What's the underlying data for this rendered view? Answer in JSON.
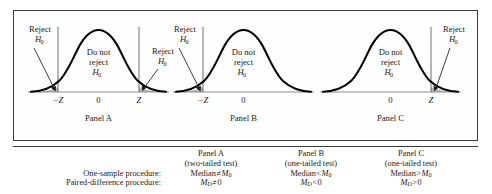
{
  "figure": {
    "panels": [
      {
        "id": "panel-a",
        "caption": "Panel A",
        "curve_label_line1": "Do not",
        "curve_label_line2": "reject",
        "curve_label_line3": "H",
        "curve_label_sub": "0",
        "axis_ticks": [
          "−Z",
          "0",
          "Z"
        ],
        "reject_labels": [
          {
            "line1": "Reject",
            "line2": "H",
            "sub": "0",
            "side": "left"
          },
          {
            "line1": "Reject",
            "line2": "H",
            "sub": "0",
            "side": "right"
          }
        ],
        "tails": [
          "left",
          "right"
        ]
      },
      {
        "id": "panel-b",
        "caption": "Panel B",
        "curve_label_line1": "Do not",
        "curve_label_line2": "reject",
        "curve_label_line3": "H",
        "curve_label_sub": "0",
        "axis_ticks": [
          "−Z",
          "0"
        ],
        "reject_labels": [
          {
            "line1": "Reject",
            "line2": "H",
            "sub": "0",
            "side": "left"
          }
        ],
        "tails": [
          "left"
        ]
      },
      {
        "id": "panel-c",
        "caption": "Panel C",
        "curve_label_line1": "Do not",
        "curve_label_line2": "reject",
        "curve_label_line3": "H",
        "curve_label_sub": "0",
        "axis_ticks": [
          "0",
          "Z"
        ],
        "reject_labels": [
          {
            "line1": "Reject",
            "line2": "H",
            "sub": "0",
            "side": "right"
          }
        ],
        "tails": [
          "right"
        ]
      }
    ]
  },
  "table": {
    "row_labels": [
      "One-sample procedure:",
      "Paired-difference procedure:"
    ],
    "columns": [
      {
        "header": "Panel A",
        "subheader": "(two-tailed test)",
        "one_sample": {
          "lhs": "Median",
          "op": "≠",
          "rhs": "M",
          "rhs_sub": "0"
        },
        "paired": {
          "lhs": "M",
          "lhs_sub": "D",
          "op": "≠",
          "rhs": "0"
        }
      },
      {
        "header": "Panel B",
        "subheader": "(one-tailed test)",
        "one_sample": {
          "lhs": "Median",
          "op": "<",
          "rhs": "M",
          "rhs_sub": "0"
        },
        "paired": {
          "lhs": "M",
          "lhs_sub": "D",
          "op": "<",
          "rhs": "0"
        }
      },
      {
        "header": "Panel C",
        "subheader": "(one-tailed test)",
        "one_sample": {
          "lhs": "Median",
          "op": ">",
          "rhs": "M",
          "rhs_sub": "0"
        },
        "paired": {
          "lhs": "M",
          "lhs_sub": "D",
          "op": ">",
          "rhs": "0"
        }
      }
    ]
  },
  "colors": {
    "frame": "#3b3b3b",
    "curve": "#000000",
    "tail_shade": "#b9b9b9",
    "baseline": "#8e8e8e",
    "text": "#1a1a1a"
  }
}
